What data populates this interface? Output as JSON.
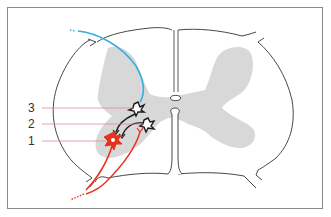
{
  "diagram": {
    "labels": [
      {
        "id": "1",
        "text": "1"
      },
      {
        "id": "2",
        "text": "2"
      },
      {
        "id": "3",
        "text": "3"
      }
    ],
    "colors": {
      "outline": "#333333",
      "gray_matter": "#d8d8d8",
      "afferent_blue": "#3aaee0",
      "motor_red": "#e8321e",
      "interneuron_black": "#1a1a1a",
      "leader_line": "#e08a96",
      "frame": "#8a8a8a"
    }
  }
}
